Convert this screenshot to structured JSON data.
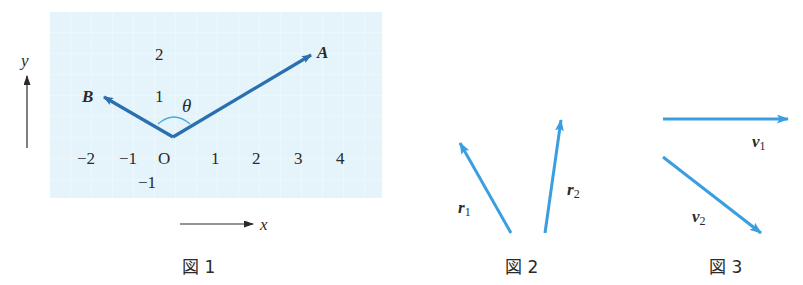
{
  "figure1": {
    "caption": "図 1",
    "grid_color": "#e6f5fb",
    "vector_color": "#2a6fb0",
    "x_axis_label": "x",
    "y_axis_label": "y",
    "origin_label": "O",
    "x_ticks": [
      "−2",
      "−1",
      "1",
      "2",
      "3",
      "4"
    ],
    "y_ticks": [
      "2",
      "1",
      "−1"
    ],
    "vectors": [
      {
        "name": "A",
        "from": [
          0,
          0
        ],
        "to": [
          3.3,
          2
        ]
      },
      {
        "name": "B",
        "from": [
          0,
          0
        ],
        "to": [
          -1.7,
          1
        ]
      }
    ],
    "angle_label": "θ"
  },
  "figure2": {
    "caption": "図 2",
    "vector_color": "#3a9ee0",
    "vectors": [
      {
        "name": "r",
        "subscript": "1"
      },
      {
        "name": "r",
        "subscript": "2"
      }
    ]
  },
  "figure3": {
    "caption": "図 3",
    "vector_color": "#3a9ee0",
    "vectors": [
      {
        "name": "v",
        "subscript": "1"
      },
      {
        "name": "v",
        "subscript": "2"
      }
    ]
  }
}
